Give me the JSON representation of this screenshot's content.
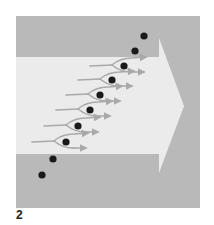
{
  "figure": {
    "label": "2",
    "colors": {
      "background": "#ffffff",
      "panel": "#b9b9b9",
      "band": "#ebebeb",
      "streamline": "#a9a9a9",
      "particle": "#1a1a1a"
    },
    "panel": {
      "x": 16,
      "y": 16,
      "width": 184,
      "height": 192
    },
    "band_arrow": {
      "left_x": 16,
      "top_y": 57,
      "bottom_y": 154,
      "shoulder_x": 159,
      "head_top_y": 38,
      "head_bottom_y": 173,
      "tip_x": 184,
      "tip_y": 106
    },
    "particles": [
      {
        "x": 144,
        "y": 36,
        "in_flow": false
      },
      {
        "x": 135,
        "y": 51,
        "in_flow": false
      },
      {
        "x": 124,
        "y": 66,
        "in_flow": true
      },
      {
        "x": 112,
        "y": 80,
        "in_flow": true
      },
      {
        "x": 100,
        "y": 95,
        "in_flow": true
      },
      {
        "x": 90,
        "y": 110,
        "in_flow": true
      },
      {
        "x": 78,
        "y": 126,
        "in_flow": true
      },
      {
        "x": 66,
        "y": 142,
        "in_flow": true
      },
      {
        "x": 53,
        "y": 159,
        "in_flow": false
      },
      {
        "x": 42,
        "y": 175,
        "in_flow": false
      }
    ],
    "particle_radius": 3.6
  }
}
